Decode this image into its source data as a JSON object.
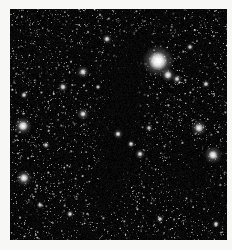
{
  "view": {
    "title": "Dark Nebula Star Field",
    "canvas_width": 232,
    "canvas_height": 250,
    "background_color": "#f7f7f5",
    "sky_color": "#000000",
    "frame": {
      "left": 10,
      "top": 9,
      "width": 217,
      "height": 231
    }
  },
  "chart_data": {
    "type": "scatter",
    "title": "Dark Nebula Star Field",
    "xlabel": "",
    "ylabel": "",
    "xlim": [
      0,
      217
    ],
    "ylim": [
      0,
      231
    ],
    "grid": false,
    "legend": null,
    "background": "#000000",
    "star_color": "#ffffff",
    "field": {
      "faint_star_count": 2600,
      "mid_star_count": 520,
      "faint_radius_range": [
        0.35,
        0.9
      ],
      "mid_radius_range": [
        0.8,
        1.7
      ],
      "faint_brightness_range": [
        0.18,
        0.62
      ],
      "mid_brightness_range": [
        0.45,
        0.95
      ],
      "random_seed": 20240517
    },
    "dark_regions": [
      {
        "name": "central-nebula-lane",
        "cx": 112,
        "cy": 95,
        "rx": 30,
        "ry": 78,
        "rotation": -6,
        "opacity": 0.97
      },
      {
        "name": "central-nebula-lane-lower",
        "cx": 104,
        "cy": 150,
        "rx": 24,
        "ry": 48,
        "rotation": 8,
        "opacity": 0.95
      },
      {
        "name": "nebula-upper-flare",
        "cx": 126,
        "cy": 42,
        "rx": 22,
        "ry": 34,
        "rotation": 12,
        "opacity": 0.88
      },
      {
        "name": "nebula-south-foot",
        "cx": 96,
        "cy": 186,
        "rx": 20,
        "ry": 26,
        "rotation": 0,
        "opacity": 0.82
      },
      {
        "name": "lower-right-dark-patch",
        "cx": 178,
        "cy": 168,
        "rx": 30,
        "ry": 22,
        "rotation": -12,
        "opacity": 0.9
      },
      {
        "name": "right-edge-dark-patch",
        "cx": 205,
        "cy": 188,
        "rx": 18,
        "ry": 16,
        "rotation": 0,
        "opacity": 0.7
      },
      {
        "name": "upper-left-shadow",
        "cx": 40,
        "cy": 30,
        "rx": 16,
        "ry": 14,
        "rotation": 0,
        "opacity": 0.45
      }
    ],
    "bright_stars": [
      {
        "name": "star-alpha",
        "x": 148,
        "y": 52,
        "radius": 9.5,
        "glow": 16,
        "brightness": 1.0
      },
      {
        "name": "star-beta",
        "x": 158,
        "y": 66,
        "radius": 4.0,
        "glow": 7,
        "brightness": 0.82
      },
      {
        "name": "star-gamma",
        "x": 13,
        "y": 117,
        "radius": 5.0,
        "glow": 9,
        "brightness": 0.86
      },
      {
        "name": "star-delta",
        "x": 14,
        "y": 169,
        "radius": 4.4,
        "glow": 8,
        "brightness": 0.84
      },
      {
        "name": "star-epsilon",
        "x": 189,
        "y": 119,
        "radius": 4.2,
        "glow": 8,
        "brightness": 0.8
      },
      {
        "name": "star-zeta",
        "x": 203,
        "y": 146,
        "radius": 4.6,
        "glow": 9,
        "brightness": 0.85
      },
      {
        "name": "star-eta",
        "x": 73,
        "y": 63,
        "radius": 3.2,
        "glow": 6,
        "brightness": 0.78
      },
      {
        "name": "star-theta",
        "x": 73,
        "y": 105,
        "radius": 3.0,
        "glow": 6,
        "brightness": 0.76
      },
      {
        "name": "star-iota",
        "x": 53,
        "y": 78,
        "radius": 2.8,
        "glow": 5,
        "brightness": 0.74
      },
      {
        "name": "star-kappa",
        "x": 97,
        "y": 30,
        "radius": 2.8,
        "glow": 5,
        "brightness": 0.74
      },
      {
        "name": "star-lambda",
        "x": 108,
        "y": 125,
        "radius": 2.6,
        "glow": 5,
        "brightness": 0.78
      },
      {
        "name": "star-mu",
        "x": 121,
        "y": 135,
        "radius": 2.4,
        "glow": 4,
        "brightness": 0.74
      },
      {
        "name": "star-nu",
        "x": 130,
        "y": 145,
        "radius": 2.6,
        "glow": 5,
        "brightness": 0.76
      },
      {
        "name": "star-xi",
        "x": 139,
        "y": 119,
        "radius": 2.2,
        "glow": 4,
        "brightness": 0.7
      },
      {
        "name": "star-omicron",
        "x": 14,
        "y": 86,
        "radius": 2.4,
        "glow": 4,
        "brightness": 0.72
      },
      {
        "name": "star-pi",
        "x": 36,
        "y": 136,
        "radius": 2.2,
        "glow": 4,
        "brightness": 0.7
      },
      {
        "name": "star-rho",
        "x": 196,
        "y": 75,
        "radius": 2.4,
        "glow": 4,
        "brightness": 0.72
      },
      {
        "name": "star-sigma",
        "x": 167,
        "y": 70,
        "radius": 2.6,
        "glow": 5,
        "brightness": 0.74
      },
      {
        "name": "star-tau",
        "x": 60,
        "y": 205,
        "radius": 2.4,
        "glow": 4,
        "brightness": 0.72
      },
      {
        "name": "star-upsilon",
        "x": 150,
        "y": 210,
        "radius": 2.2,
        "glow": 4,
        "brightness": 0.7
      },
      {
        "name": "star-phi",
        "x": 206,
        "y": 215,
        "radius": 2.4,
        "glow": 4,
        "brightness": 0.72
      },
      {
        "name": "star-chi",
        "x": 30,
        "y": 196,
        "radius": 2.2,
        "glow": 4,
        "brightness": 0.7
      },
      {
        "name": "star-psi",
        "x": 88,
        "y": 78,
        "radius": 2.0,
        "glow": 3,
        "brightness": 0.68
      },
      {
        "name": "star-omega",
        "x": 180,
        "y": 38,
        "radius": 2.2,
        "glow": 4,
        "brightness": 0.7
      }
    ]
  }
}
